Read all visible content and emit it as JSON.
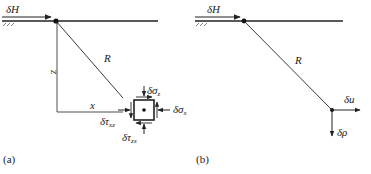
{
  "panel_a": {
    "caption": "(a)",
    "load_label": "δH",
    "radius_label": "R",
    "depth_label": "z",
    "offset_label": "x",
    "sigma_z": {
      "base": "δσ",
      "sub": "z"
    },
    "sigma_x": {
      "base": "δσ",
      "sub": "x"
    },
    "tau_xz": {
      "base": "δτ",
      "sub": "xz"
    },
    "tau_zx": {
      "base": "δτ",
      "sub": "zx"
    }
  },
  "panel_b": {
    "caption": "(b)",
    "load_label": "δH",
    "radius_label": "R",
    "disp_u": "δu",
    "disp_rho": "δρ"
  },
  "colors": {
    "line": "#222222",
    "background": "#ffffff"
  }
}
